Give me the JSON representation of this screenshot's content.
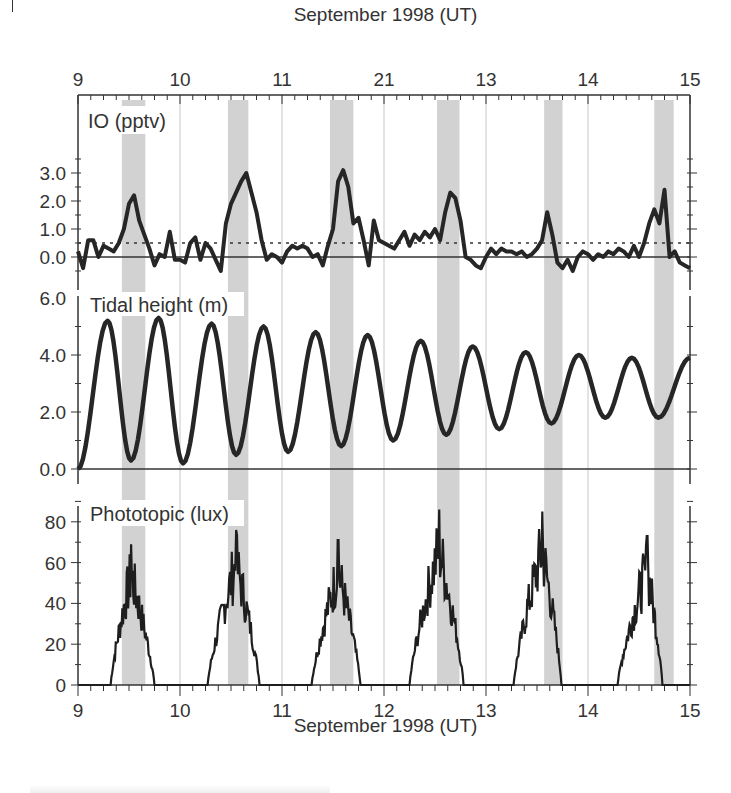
{
  "figure": {
    "top_axis_title": "September 1998 (UT)",
    "bottom_axis_title": "September 1998 (UT)"
  },
  "chart_data": [
    {
      "type": "line",
      "panel": "top",
      "title": "IO (pptv)",
      "ylabel": "IO (pptv)",
      "xlabel": "September 1998 (UT)",
      "xlim": [
        9,
        15
      ],
      "ylim": [
        -0.6,
        3.4
      ],
      "yticks": [
        0.0,
        1.0,
        2.0,
        3.0
      ],
      "ytick_labels": [
        "0.0",
        "1.0",
        "2.0",
        "3.0"
      ],
      "top_xtick_labels": [
        "9",
        "10",
        "11",
        "21",
        "13",
        "14",
        "15"
      ],
      "reference_lines": [
        {
          "y": 0.0,
          "style": "solid"
        },
        {
          "y": 0.5,
          "style": "dotted",
          "note": "detection limit"
        }
      ],
      "x": [
        9.0,
        9.05,
        9.1,
        9.15,
        9.2,
        9.25,
        9.3,
        9.35,
        9.4,
        9.45,
        9.5,
        9.55,
        9.6,
        9.65,
        9.7,
        9.75,
        9.8,
        9.85,
        9.9,
        9.95,
        10.0,
        10.05,
        10.1,
        10.15,
        10.2,
        10.25,
        10.3,
        10.35,
        10.4,
        10.45,
        10.5,
        10.55,
        10.6,
        10.65,
        10.7,
        10.75,
        10.8,
        10.85,
        10.9,
        10.95,
        11.0,
        11.05,
        11.1,
        11.15,
        11.2,
        11.25,
        11.3,
        11.35,
        11.4,
        11.45,
        11.5,
        11.55,
        11.6,
        11.65,
        11.7,
        11.75,
        11.8,
        11.85,
        11.9,
        11.95,
        12.0,
        12.05,
        12.1,
        12.15,
        12.2,
        12.25,
        12.3,
        12.35,
        12.4,
        12.45,
        12.5,
        12.55,
        12.6,
        12.65,
        12.7,
        12.75,
        12.8,
        12.85,
        12.9,
        12.95,
        13.0,
        13.05,
        13.1,
        13.15,
        13.2,
        13.25,
        13.3,
        13.35,
        13.4,
        13.45,
        13.5,
        13.55,
        13.6,
        13.65,
        13.7,
        13.75,
        13.8,
        13.85,
        13.9,
        13.95,
        14.0,
        14.05,
        14.1,
        14.15,
        14.2,
        14.25,
        14.3,
        14.35,
        14.4,
        14.45,
        14.5,
        14.55,
        14.6,
        14.65,
        14.7,
        14.75,
        14.8,
        14.85,
        14.9,
        14.95,
        15.0
      ],
      "values": [
        0.2,
        -0.4,
        0.6,
        0.6,
        0.0,
        0.4,
        0.3,
        0.2,
        0.5,
        1.0,
        1.9,
        2.2,
        1.3,
        0.8,
        0.3,
        -0.3,
        0.1,
        0.0,
        0.9,
        -0.1,
        -0.1,
        -0.2,
        0.5,
        0.7,
        -0.1,
        0.5,
        0.3,
        -0.1,
        -0.5,
        1.2,
        1.9,
        2.3,
        2.7,
        3.0,
        2.3,
        1.6,
        0.6,
        -0.1,
        0.1,
        0.0,
        -0.2,
        0.2,
        0.4,
        0.3,
        0.4,
        0.3,
        0.0,
        0.1,
        -0.3,
        0.4,
        1.0,
        2.7,
        3.1,
        2.5,
        1.2,
        1.4,
        0.6,
        -0.3,
        1.3,
        0.6,
        0.5,
        0.4,
        0.3,
        0.6,
        0.9,
        0.4,
        0.8,
        0.6,
        0.9,
        0.7,
        1.0,
        0.6,
        1.6,
        2.3,
        2.1,
        1.3,
        0.0,
        -0.1,
        -0.3,
        -0.4,
        0.0,
        0.3,
        0.1,
        0.3,
        0.2,
        0.2,
        0.1,
        0.2,
        0.0,
        0.1,
        0.3,
        0.6,
        1.6,
        0.8,
        -0.2,
        -0.4,
        -0.1,
        -0.5,
        0.0,
        0.2,
        0.1,
        -0.1,
        0.1,
        0.0,
        0.2,
        0.1,
        0.3,
        0.2,
        0.0,
        0.4,
        0.0,
        0.5,
        1.2,
        1.7,
        1.2,
        2.4,
        0.0,
        0.2,
        -0.2,
        -0.3,
        -0.4
      ],
      "shaded_intervals": [
        [
          9.43,
          9.66
        ],
        [
          10.47,
          10.67
        ],
        [
          11.47,
          11.7
        ],
        [
          12.52,
          12.74
        ],
        [
          13.57,
          13.75
        ],
        [
          14.65,
          14.84
        ]
      ]
    },
    {
      "type": "line",
      "panel": "middle",
      "title": "Tidal height (m)",
      "ylabel": "Tidal height (m)",
      "xlim": [
        9,
        15
      ],
      "ylim": [
        -0.6,
        6.0
      ],
      "yticks": [
        0.0,
        2.0,
        4.0,
        6.0
      ],
      "ytick_labels": [
        "0.0",
        "2.0",
        "4.0",
        "6.0"
      ],
      "x": [
        9.0,
        9.29,
        9.52,
        9.79,
        10.03,
        10.31,
        10.55,
        10.82,
        11.06,
        11.33,
        11.58,
        11.84,
        12.09,
        12.36,
        12.61,
        12.87,
        13.13,
        13.39,
        13.64,
        13.91,
        14.17,
        14.43,
        14.69,
        15.0
      ],
      "values": [
        0.0,
        5.2,
        0.3,
        5.3,
        0.2,
        5.1,
        0.5,
        5.0,
        0.6,
        4.8,
        0.8,
        4.7,
        1.0,
        4.5,
        1.2,
        4.3,
        1.4,
        4.1,
        1.6,
        4.0,
        1.8,
        3.9,
        1.8,
        3.9
      ],
      "shaded_intervals": [
        [
          9.43,
          9.66
        ],
        [
          10.47,
          10.67
        ],
        [
          11.47,
          11.7
        ],
        [
          12.52,
          12.74
        ],
        [
          13.57,
          13.75
        ],
        [
          14.65,
          14.84
        ]
      ]
    },
    {
      "type": "line",
      "panel": "bottom",
      "title": "Phototopic (lux)",
      "ylabel": "Phototopic (lux)",
      "xlabel": "September 1998 (UT)",
      "xlim": [
        9,
        15
      ],
      "ylim": [
        0,
        90
      ],
      "yticks": [
        0,
        20,
        40,
        60,
        80
      ],
      "ytick_labels": [
        "0",
        "20",
        "40",
        "60",
        "80"
      ],
      "xticks": [
        9,
        10,
        11,
        12,
        13,
        14,
        15
      ],
      "xtick_labels": [
        "9",
        "10",
        "11",
        "12",
        "13",
        "14",
        "15"
      ],
      "daily_peaks": [
        {
          "day": 9,
          "start": 9.32,
          "peak_x": 9.52,
          "peak": 69,
          "end": 9.75
        },
        {
          "day": 10,
          "start": 10.27,
          "peak_x": 10.55,
          "peak": 76,
          "end": 10.78
        },
        {
          "day": 11,
          "start": 11.29,
          "peak_x": 11.55,
          "peak": 71,
          "end": 11.77
        },
        {
          "day": 12,
          "start": 12.25,
          "peak_x": 12.54,
          "peak": 86,
          "end": 12.78
        },
        {
          "day": 13,
          "start": 13.27,
          "peak_x": 13.55,
          "peak": 85,
          "end": 13.74
        },
        {
          "day": 14,
          "start": 14.29,
          "peak_x": 14.58,
          "peak": 73,
          "end": 14.73
        }
      ],
      "shaded_intervals": [
        [
          9.43,
          9.66
        ],
        [
          10.47,
          10.67
        ],
        [
          11.47,
          11.7
        ],
        [
          12.52,
          12.74
        ],
        [
          13.57,
          13.75
        ],
        [
          14.65,
          14.84
        ]
      ]
    }
  ]
}
